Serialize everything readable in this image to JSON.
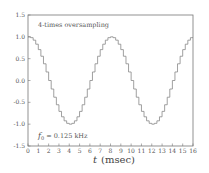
{
  "chart_data": {
    "type": "line",
    "style": "step",
    "title": "",
    "xlabel": "t (msec)",
    "xlabel_italic": "t",
    "xlabel_unit": "(msec)",
    "ylabel": "",
    "xlim": [
      0,
      16
    ],
    "ylim": [
      -1.5,
      1.5
    ],
    "xticks": [
      0,
      1,
      2,
      3,
      4,
      5,
      6,
      7,
      8,
      9,
      10,
      11,
      12,
      13,
      14,
      15,
      16
    ],
    "xtick_labels": [
      "0",
      "1",
      "2",
      "3",
      "4",
      "5",
      "6",
      "7",
      "8",
      "9",
      "10",
      "11",
      "12",
      "13",
      "14",
      "15",
      "16"
    ],
    "yticks": [
      1.5,
      1.0,
      0.5,
      0.0,
      -0.5,
      -1.0,
      -1.5
    ],
    "ytick_labels": [
      "1.5",
      "1.0",
      "0.5",
      "0.0",
      "-0.5",
      "-1.0",
      "-1.5"
    ],
    "grid": false,
    "annotations": [
      {
        "text": "4-times oversampling",
        "x": 1,
        "y": 1.3
      },
      {
        "text": "f0 = 0.125 kHz",
        "x": 1,
        "y": -1.3
      }
    ],
    "series": [
      {
        "name": "staircase cosine",
        "function": "cos(2*pi*f0*t)",
        "f0_khz": 0.125,
        "period_ms": 8,
        "sample_step_ms": 0.25,
        "t_start": 0,
        "t_end": 16,
        "color": "#888888"
      }
    ]
  },
  "annotations": {
    "top_text": "4-times oversampling",
    "bottom_text_symbol": "f",
    "bottom_text_sub": "0",
    "bottom_text_rest": " = 0.125 kHz"
  },
  "axis": {
    "xlabel_var": "t",
    "xlabel_unit": "(msec)"
  },
  "colors": {
    "axes": "#777777",
    "curve": "#888888",
    "text": "#555555"
  }
}
